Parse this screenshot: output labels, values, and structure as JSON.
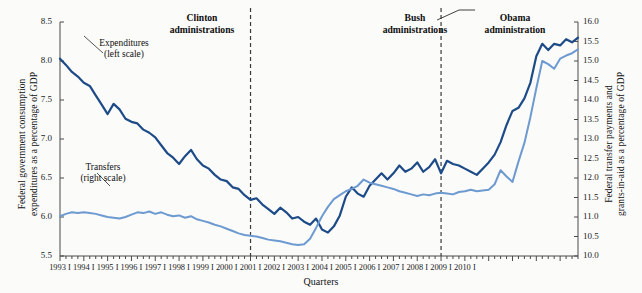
{
  "chart_data": {
    "type": "line",
    "title": "",
    "xlabel": "Quarters",
    "ylabel": "Federal government consumption expenditures as a percentage of GDP",
    "ylabel_right": "Federal transfer payments and grants-in-aid as a percentage of GDP",
    "ylim": [
      5.5,
      8.5
    ],
    "ylim_right": [
      10.0,
      16.0
    ],
    "yticks": [
      "5.5",
      "6.0",
      "6.5",
      "7.0",
      "7.5",
      "8.0",
      "8.5"
    ],
    "yticks_right": [
      "10.0",
      "10.5",
      "11.0",
      "11.5",
      "12.0",
      "12.5",
      "13.0",
      "13.5",
      "14.0",
      "14.5",
      "15.0",
      "15.5",
      "16.0"
    ],
    "xticks": [
      "1993 I",
      "1994 I",
      "1995 I",
      "1996 I",
      "1997 I",
      "1998 I",
      "1999 I",
      "2000 I",
      "2001 I",
      "2002 I",
      "2003 I",
      "2004 I",
      "2005 I",
      "2006 I",
      "2007 I",
      "2008 I",
      "2009 I",
      "2010 I"
    ],
    "grid": false,
    "legend_position": "inline-annotations",
    "series": [
      {
        "name": "Expenditures (left scale)",
        "axis": "left",
        "color": "#1d4b87",
        "values": [
          8.03,
          7.95,
          7.86,
          7.8,
          7.72,
          7.68,
          7.56,
          7.44,
          7.32,
          7.45,
          7.38,
          7.26,
          7.22,
          7.2,
          7.12,
          7.08,
          7.02,
          6.92,
          6.82,
          6.76,
          6.68,
          6.78,
          6.86,
          6.74,
          6.66,
          6.62,
          6.54,
          6.48,
          6.46,
          6.38,
          6.36,
          6.28,
          6.22,
          6.24,
          6.16,
          6.1,
          6.04,
          6.12,
          6.06,
          5.98,
          6.0,
          5.94,
          5.9,
          5.98,
          5.84,
          5.8,
          5.88,
          6.02,
          6.26,
          6.38,
          6.3,
          6.26,
          6.4,
          6.48,
          6.56,
          6.48,
          6.56,
          6.66,
          6.58,
          6.62,
          6.7,
          6.58,
          6.64,
          6.74,
          6.56,
          6.72,
          6.68,
          6.66,
          6.62,
          6.58,
          6.54,
          6.62,
          6.7,
          6.8,
          6.96,
          7.18,
          7.36,
          7.4,
          7.52,
          7.72,
          8.06,
          8.22,
          8.14,
          8.22,
          8.2,
          8.28,
          8.24,
          8.3
        ]
      },
      {
        "name": "Transfers (right scale)",
        "axis": "right",
        "color": "#6d9ad0",
        "values": [
          11.02,
          11.08,
          11.12,
          11.1,
          11.12,
          11.1,
          11.08,
          11.04,
          11.0,
          10.98,
          10.96,
          11.0,
          11.06,
          11.12,
          11.1,
          11.14,
          11.08,
          11.12,
          11.06,
          11.02,
          11.04,
          10.98,
          11.02,
          10.94,
          10.9,
          10.86,
          10.8,
          10.76,
          10.7,
          10.64,
          10.58,
          10.54,
          10.52,
          10.5,
          10.46,
          10.42,
          10.4,
          10.38,
          10.34,
          10.3,
          10.28,
          10.3,
          10.44,
          10.72,
          11.02,
          11.26,
          11.46,
          11.56,
          11.66,
          11.72,
          11.8,
          11.96,
          11.88,
          11.84,
          11.8,
          11.76,
          11.72,
          11.66,
          11.62,
          11.58,
          11.54,
          11.58,
          11.56,
          11.6,
          11.62,
          11.6,
          11.58,
          11.64,
          11.66,
          11.7,
          11.66,
          11.68,
          11.7,
          11.84,
          12.2,
          12.04,
          11.9,
          12.42,
          12.9,
          13.56,
          14.3,
          15.0,
          14.92,
          14.8,
          15.06,
          15.14,
          15.2,
          15.3
        ]
      }
    ],
    "annotations": [
      {
        "name": "clinton-divider",
        "type": "vline",
        "label": "2001 I boundary",
        "x_index": 32
      },
      {
        "name": "obama-divider",
        "type": "vline",
        "label": "2009 I boundary",
        "x_index": 64
      }
    ]
  },
  "labels": {
    "admin_clinton_line1": "Clinton",
    "admin_clinton_line2": "administrations",
    "admin_bush_line1": "Bush",
    "admin_bush_line2": "administrations",
    "admin_obama_line1": "Obama",
    "admin_obama_line2": "administration",
    "series_expenditures_line1": "Expenditures",
    "series_expenditures_line2": "(left scale)",
    "series_transfers_line1": "Transfers",
    "series_transfers_line2": "(right scale)",
    "ylabel_left_line1": "Federal government consumption",
    "ylabel_left_line2": "expenditures as a percentage of GDP",
    "ylabel_right_line1": "Federal transfer payments and",
    "ylabel_right_line2": "grants-in-aid as a percentage of GDP",
    "xlabel": "Quarters"
  },
  "colors": {
    "expenditures": "#1d4b87",
    "transfers": "#6d9ad0",
    "axis": "#4a4a4a",
    "divider": "#3a3a3a",
    "background": "#fbfbfa"
  }
}
